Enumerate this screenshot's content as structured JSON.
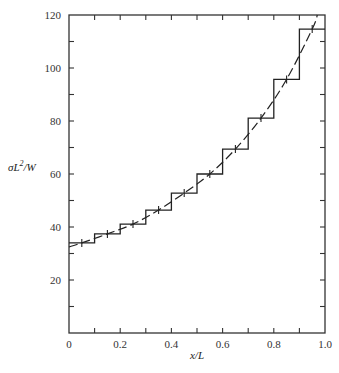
{
  "chart_data": {
    "type": "line",
    "title": "",
    "xlabel": "x/L",
    "ylabel_parts": {
      "base": "σL",
      "sup": "2",
      "tail": "/W"
    },
    "ylabel": "σL²/W",
    "xlim": [
      0,
      1.0
    ],
    "ylim": [
      0,
      120
    ],
    "x_tick_labels": [
      "0",
      "0.2",
      "0.4",
      "0.6",
      "0.8",
      "1.0"
    ],
    "x_ticks": [
      0,
      0.2,
      0.4,
      0.6,
      0.8,
      1.0
    ],
    "x_minor_ticks": [
      0.1,
      0.3,
      0.5,
      0.7,
      0.9
    ],
    "y_tick_labels": [
      "20",
      "40",
      "60",
      "80",
      "100",
      "120"
    ],
    "y_ticks": [
      20,
      40,
      60,
      80,
      100,
      120
    ],
    "y_minor_ticks": [
      10,
      30,
      50,
      70,
      90,
      110
    ],
    "grid": false,
    "legend": null,
    "series": [
      {
        "name": "Step approximation (piecewise constant)",
        "style": "solid-step",
        "x_edges": [
          0,
          0.1,
          0.2,
          0.3,
          0.4,
          0.5,
          0.6,
          0.7,
          0.8,
          0.9,
          1.0
        ],
        "values": [
          34.0,
          37.4,
          41.1,
          46.4,
          52.8,
          60.0,
          69.4,
          81.1,
          95.7,
          114.7
        ]
      },
      {
        "name": "Continuous solution",
        "style": "dashed",
        "x": [
          0,
          0.05,
          0.15,
          0.25,
          0.35,
          0.45,
          0.55,
          0.65,
          0.75,
          0.85,
          0.95,
          0.97
        ],
        "values": [
          32.5,
          34.0,
          37.4,
          41.1,
          46.4,
          52.8,
          60.0,
          69.4,
          81.1,
          95.7,
          114.7,
          120
        ]
      }
    ]
  }
}
